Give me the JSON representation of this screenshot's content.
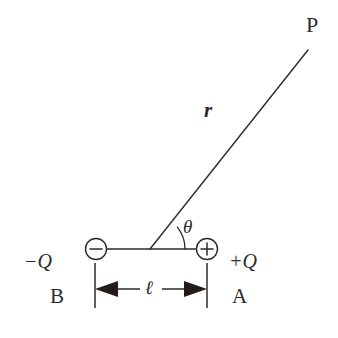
{
  "figure": {
    "type": "physics-diagram",
    "background_color": "#ffffff",
    "stroke_color": "#2b2b2b",
    "width": 338,
    "height": 338
  },
  "charges": {
    "negative": {
      "glyph": "minus-sign",
      "charge_label": "−Q",
      "point_label": "B",
      "center_x": 96,
      "center_y": 249,
      "radius": 11
    },
    "positive": {
      "glyph": "plus-sign",
      "charge_label": "+Q",
      "point_label": "A",
      "center_x": 207,
      "center_y": 249,
      "radius": 11
    }
  },
  "field_point": {
    "label": "P",
    "x": 308,
    "y": 50
  },
  "ray": {
    "distance_label": "r",
    "origin_x": 150,
    "origin_y": 249,
    "end_x": 308,
    "end_y": 50
  },
  "angle": {
    "label": "θ",
    "vertex_x": 150,
    "vertex_y": 249,
    "arc_radius": 35,
    "degrees": 45
  },
  "separation": {
    "label": "ℓ",
    "left_x": 95,
    "right_x": 207,
    "dimension_y": 289
  },
  "axis": {
    "left_x": 96,
    "right_x": 207,
    "y": 249
  }
}
